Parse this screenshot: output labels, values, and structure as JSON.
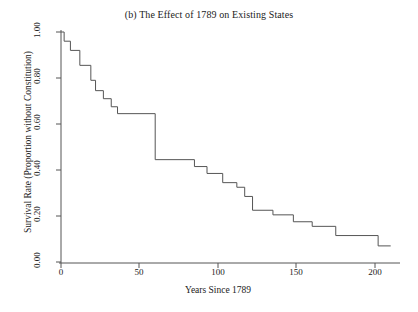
{
  "chart_data": {
    "type": "line",
    "subtype": "step-kaplan-meier",
    "title": "(b) The Effect of 1789 on Existing States",
    "xlabel": "Years Since 1789",
    "ylabel": "Survival Rate (Proportion without Constitution)",
    "xlim": [
      0,
      215
    ],
    "ylim": [
      0.0,
      1.0
    ],
    "grid": false,
    "legend": null,
    "xticks": [
      0,
      50,
      100,
      150,
      200
    ],
    "xtick_labels": [
      "0",
      "50",
      "100",
      "150",
      "200"
    ],
    "yticks": [
      0.0,
      0.2,
      0.4,
      0.6,
      0.8,
      1.0
    ],
    "ytick_labels": [
      "0.00",
      "0.20",
      "0.40",
      "0.60",
      "0.80",
      "1.00"
    ],
    "line_color": "#555555",
    "line_width": 1,
    "series": [
      {
        "name": "Survival Rate",
        "x": [
          0,
          2,
          2,
          6,
          6,
          12,
          12,
          19,
          19,
          22,
          22,
          27,
          27,
          32,
          32,
          36,
          36,
          60,
          60,
          85,
          85,
          93,
          93,
          103,
          103,
          112,
          112,
          117,
          117,
          122,
          122,
          135,
          135,
          148,
          148,
          160,
          160,
          175,
          175,
          202,
          202,
          210
        ],
        "y": [
          1.0,
          1.0,
          0.96,
          0.96,
          0.92,
          0.92,
          0.855,
          0.855,
          0.79,
          0.79,
          0.745,
          0.745,
          0.71,
          0.71,
          0.675,
          0.675,
          0.645,
          0.645,
          0.445,
          0.445,
          0.415,
          0.415,
          0.385,
          0.385,
          0.345,
          0.345,
          0.325,
          0.325,
          0.285,
          0.285,
          0.225,
          0.225,
          0.205,
          0.205,
          0.175,
          0.175,
          0.155,
          0.155,
          0.115,
          0.115,
          0.07,
          0.07
        ]
      }
    ],
    "steps": [
      {
        "year": 0,
        "survival": 1.0
      },
      {
        "year": 2,
        "survival": 0.96
      },
      {
        "year": 6,
        "survival": 0.92
      },
      {
        "year": 12,
        "survival": 0.855
      },
      {
        "year": 19,
        "survival": 0.79
      },
      {
        "year": 22,
        "survival": 0.745
      },
      {
        "year": 27,
        "survival": 0.71
      },
      {
        "year": 32,
        "survival": 0.675
      },
      {
        "year": 36,
        "survival": 0.645
      },
      {
        "year": 60,
        "survival": 0.445
      },
      {
        "year": 85,
        "survival": 0.415
      },
      {
        "year": 93,
        "survival": 0.385
      },
      {
        "year": 103,
        "survival": 0.345
      },
      {
        "year": 112,
        "survival": 0.325
      },
      {
        "year": 117,
        "survival": 0.285
      },
      {
        "year": 122,
        "survival": 0.225
      },
      {
        "year": 135,
        "survival": 0.205
      },
      {
        "year": 148,
        "survival": 0.175
      },
      {
        "year": 160,
        "survival": 0.155
      },
      {
        "year": 175,
        "survival": 0.115
      },
      {
        "year": 202,
        "survival": 0.07
      },
      {
        "year": 210,
        "survival": 0.07
      }
    ]
  }
}
